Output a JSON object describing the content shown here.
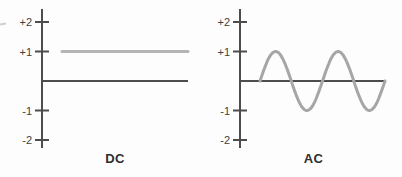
{
  "figure": {
    "colors": {
      "background": "#fdfdfd",
      "axis": "#4d4d4d",
      "tick_label": "#3f3f3f",
      "title": "#2e2e2e",
      "edge_artifact": "#cfcfcf"
    }
  },
  "chart_data": [
    {
      "id": "dc",
      "type": "line",
      "title": "DC",
      "xlabel": "",
      "ylabel": "",
      "ylim": [
        -2.4,
        2.4
      ],
      "grid": false,
      "legend": "none",
      "yticks": [
        {
          "value": 2,
          "label": "+2"
        },
        {
          "value": 1,
          "label": "+1"
        },
        {
          "value": -1,
          "label": "-1"
        },
        {
          "value": -2,
          "label": "-2"
        }
      ],
      "series": [
        {
          "name": "DC signal",
          "waveform": "constant",
          "value": 1,
          "color": "#b5b5b5"
        }
      ]
    },
    {
      "id": "ac",
      "type": "line",
      "title": "AC",
      "xlabel": "",
      "ylabel": "",
      "ylim": [
        -2.4,
        2.4
      ],
      "grid": false,
      "legend": "none",
      "yticks": [
        {
          "value": 2,
          "label": "+2"
        },
        {
          "value": 1,
          "label": "+1"
        },
        {
          "value": -1,
          "label": "-1"
        },
        {
          "value": -2,
          "label": "-2"
        }
      ],
      "series": [
        {
          "name": "AC signal",
          "waveform": "sine",
          "amplitude": 1,
          "cycles": 2,
          "start_phase": 0,
          "color": "#a6a6a6"
        }
      ]
    }
  ]
}
